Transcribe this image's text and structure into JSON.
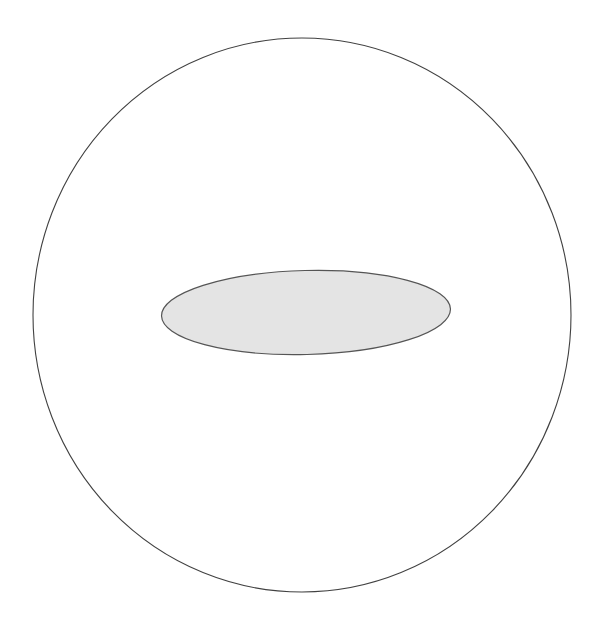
{
  "canvas": {
    "width": 605,
    "height": 628,
    "background_color": "#ffffff",
    "title": "Concentric shapes diagram"
  },
  "figure": {
    "type": "geometric-diagram",
    "shapes": [
      {
        "name": "outer-circle",
        "kind": "circle",
        "center_x": 302,
        "center_y": 315,
        "radius_x": 269,
        "radius_y": 277,
        "fill": "none",
        "stroke": "#414141",
        "stroke_width": 1.1,
        "rotation_deg": 0,
        "label": ""
      },
      {
        "name": "inner-ellipse",
        "kind": "ellipse",
        "center_x": 306,
        "center_y": 312.5,
        "radius_x": 144.5,
        "radius_y": 42,
        "fill": "#e4e4e4",
        "stroke": "#555555",
        "stroke_width": 1.2,
        "rotation_deg": -1.4,
        "label": ""
      }
    ]
  },
  "colors": {
    "background": "#ffffff",
    "outline": "#414141",
    "ellipse_fill": "#e4e4e4",
    "ellipse_outline": "#555555"
  },
  "annotations": {
    "text_items": []
  }
}
